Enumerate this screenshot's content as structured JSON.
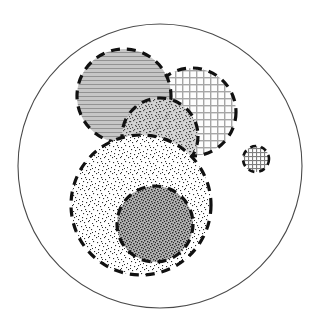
{
  "canvas": {
    "width": 322,
    "height": 333,
    "background": "#ffffff"
  },
  "chart_data": {
    "type": "diagram",
    "subtype": "venn-euler-set-diagram",
    "title": "",
    "xlabel": "",
    "ylabel": "",
    "grid": false,
    "legend": "none",
    "universe": {
      "name": "universe-circle",
      "cx": 160,
      "cy": 166,
      "r": 142,
      "stroke": "#4a4a4a",
      "stroke_width": 1.1,
      "stroke_style": "solid",
      "fill": "none"
    },
    "regions": [
      {
        "id": "region-horizontal-lines",
        "label": "horizontal-line-fill-circle",
        "cx": 124,
        "cy": 96,
        "r": 47,
        "texture": "horizontal-lines",
        "fill_base": "#c3c3c3",
        "line_color": "#8f8f8f",
        "stroke": "#111111",
        "stroke_width": 3.2,
        "stroke_style": "dashed",
        "dash": "9 7",
        "z": 3
      },
      {
        "id": "region-grid-large",
        "label": "cross-hatch-grid-circle",
        "cx": 192,
        "cy": 112,
        "r": 44,
        "texture": "grid",
        "fill_base": "#ffffff",
        "line_color": "#a0a0a0",
        "stroke": "#111111",
        "stroke_width": 3.2,
        "stroke_style": "dashed",
        "dash": "9 7",
        "z": 2
      },
      {
        "id": "region-medium-speckle",
        "label": "medium-speckle-circle",
        "cx": 160,
        "cy": 136,
        "r": 38,
        "texture": "speckle-medium",
        "fill_base": "#cfcfcf",
        "line_color": "#4e4e4e",
        "stroke": "#111111",
        "stroke_width": 3.2,
        "stroke_style": "dashed",
        "dash": "9 7",
        "z": 4
      },
      {
        "id": "region-light-speckle",
        "label": "large-light-speckle-circle",
        "cx": 141,
        "cy": 205,
        "r": 70,
        "texture": "speckle-light",
        "fill_base": "#ffffff",
        "line_color": "#2b2b2b",
        "stroke": "#111111",
        "stroke_width": 3.2,
        "stroke_style": "dashed",
        "dash": "9 7",
        "z": 5
      },
      {
        "id": "region-dark-speckle",
        "label": "dark-speckle-inner-circle",
        "cx": 155,
        "cy": 224,
        "r": 38,
        "texture": "speckle-dark",
        "fill_base": "#9a9a9a",
        "line_color": "#1d1d1d",
        "stroke": "#111111",
        "stroke_width": 3.2,
        "stroke_style": "dashed",
        "dash": "9 7",
        "z": 6
      },
      {
        "id": "region-grid-small",
        "label": "small-cross-hatch-circle",
        "cx": 256,
        "cy": 159,
        "r": 13,
        "texture": "grid-fine",
        "fill_base": "#ffffff",
        "line_color": "#6e6e6e",
        "stroke": "#111111",
        "stroke_width": 2.6,
        "stroke_style": "dashed",
        "dash": "6 5",
        "z": 7
      }
    ],
    "colors": {
      "outline": "#4a4a4a",
      "dash_stroke": "#111111",
      "background": "#ffffff"
    }
  }
}
